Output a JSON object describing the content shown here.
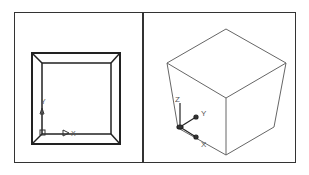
{
  "views": [
    {
      "name": "top-view",
      "axes": {
        "x_label": "X",
        "y_label": "Y"
      }
    },
    {
      "name": "isometric-view",
      "axes": {
        "x_label": "X",
        "y_label": "Y",
        "z_label": "Z"
      }
    }
  ],
  "colors": {
    "line": "#333333",
    "thin_line": "#666666",
    "label": "#555555"
  }
}
